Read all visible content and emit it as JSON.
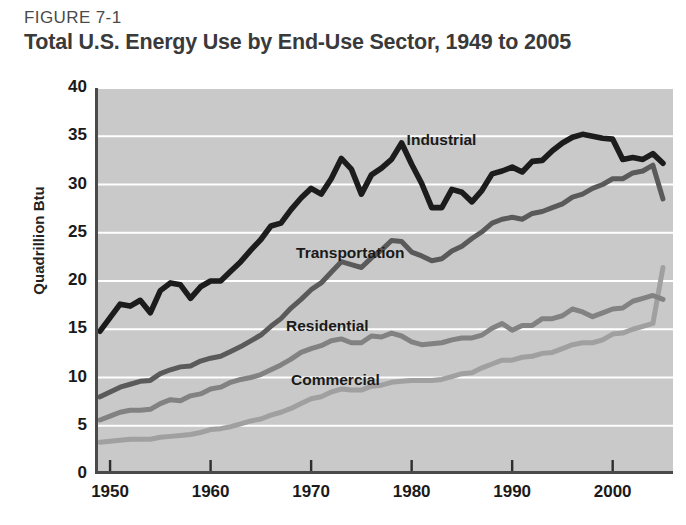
{
  "figure": {
    "number_label": "FIGURE 7-1",
    "title": "Total U.S. Energy Use by End-Use Sector, 1949 to 2005"
  },
  "axes": {
    "ylabel": "Quadrillion Btu",
    "yticks": [
      "0",
      "5",
      "10",
      "15",
      "20",
      "25",
      "30",
      "35",
      "40"
    ],
    "xticks": [
      "1950",
      "1960",
      "1970",
      "1980",
      "1990",
      "2000"
    ]
  },
  "series_labels": {
    "industrial": "Industrial",
    "transportation": "Transportation",
    "residential": "Residential",
    "commercial": "Commercial"
  },
  "colors": {
    "plot_background": "#c9c9c9",
    "gridline": "#ffffff",
    "axis": "#4a4a4a",
    "industrial": "#1c1c1c",
    "transportation": "#5a5a5a",
    "residential": "#828282",
    "commercial": "#a0a0a0",
    "title_text": "#3a3a3a",
    "label_text": "#4a4a4a"
  },
  "chart_data": {
    "type": "line",
    "title": "Total U.S. Energy Use by End-Use Sector, 1949 to 2005",
    "xlabel": "",
    "ylabel": "Quadrillion Btu",
    "xlim": [
      1948.5,
      2006
    ],
    "ylim": [
      0,
      40
    ],
    "ytick_step": 5,
    "xtick_values": [
      1950,
      1960,
      1970,
      1980,
      1990,
      2000
    ],
    "grid": "horizontal",
    "legend": "inline-labels",
    "x": [
      1949,
      1950,
      1951,
      1952,
      1953,
      1954,
      1955,
      1956,
      1957,
      1958,
      1959,
      1960,
      1961,
      1962,
      1963,
      1964,
      1965,
      1966,
      1967,
      1968,
      1969,
      1970,
      1971,
      1972,
      1973,
      1974,
      1975,
      1976,
      1977,
      1978,
      1979,
      1980,
      1981,
      1982,
      1983,
      1984,
      1985,
      1986,
      1987,
      1988,
      1989,
      1990,
      1991,
      1992,
      1993,
      1994,
      1995,
      1996,
      1997,
      1998,
      1999,
      2000,
      2001,
      2002,
      2003,
      2004,
      2005
    ],
    "series": [
      {
        "name": "Industrial",
        "color": "#1c1c1c",
        "values": [
          14.8,
          16.2,
          17.6,
          17.4,
          18.0,
          16.7,
          19.0,
          19.8,
          19.6,
          18.2,
          19.4,
          20.0,
          20.0,
          21.0,
          22.0,
          23.2,
          24.3,
          25.7,
          26.0,
          27.4,
          28.6,
          29.6,
          29.0,
          30.6,
          32.7,
          31.6,
          29.0,
          31.0,
          31.7,
          32.6,
          34.3,
          32.1,
          30.1,
          27.6,
          27.6,
          29.5,
          29.2,
          28.2,
          29.4,
          31.1,
          31.4,
          31.8,
          31.3,
          32.4,
          32.5,
          33.5,
          34.3,
          34.9,
          35.2,
          35.0,
          34.8,
          34.7,
          32.6,
          32.8,
          32.6,
          33.2,
          32.2
        ]
      },
      {
        "name": "Transportation",
        "color": "#5a5a5a",
        "values": [
          8.0,
          8.5,
          9.0,
          9.3,
          9.6,
          9.7,
          10.4,
          10.8,
          11.1,
          11.2,
          11.7,
          12.0,
          12.2,
          12.7,
          13.2,
          13.8,
          14.4,
          15.3,
          16.1,
          17.2,
          18.1,
          19.1,
          19.8,
          20.9,
          22.0,
          21.7,
          21.4,
          22.4,
          23.2,
          24.2,
          24.1,
          23.0,
          22.6,
          22.1,
          22.3,
          23.1,
          23.6,
          24.4,
          25.1,
          26.0,
          26.4,
          26.6,
          26.4,
          27.0,
          27.2,
          27.6,
          28.0,
          28.7,
          29.0,
          29.6,
          30.0,
          30.6,
          30.6,
          31.2,
          31.4,
          32.0,
          28.5
        ]
      },
      {
        "name": "Residential",
        "color": "#828282",
        "values": [
          5.6,
          6.0,
          6.4,
          6.6,
          6.6,
          6.7,
          7.3,
          7.7,
          7.6,
          8.1,
          8.3,
          8.8,
          9.0,
          9.5,
          9.8,
          10.0,
          10.3,
          10.8,
          11.3,
          11.9,
          12.6,
          13.0,
          13.3,
          13.8,
          14.0,
          13.6,
          13.6,
          14.3,
          14.2,
          14.6,
          14.3,
          13.7,
          13.4,
          13.5,
          13.6,
          13.9,
          14.1,
          14.1,
          14.4,
          15.1,
          15.6,
          14.9,
          15.4,
          15.4,
          16.1,
          16.1,
          16.4,
          17.1,
          16.8,
          16.3,
          16.7,
          17.1,
          17.2,
          17.9,
          18.2,
          18.5,
          18.1
        ]
      },
      {
        "name": "Commercial",
        "color": "#a0a0a0",
        "values": [
          3.3,
          3.4,
          3.5,
          3.6,
          3.6,
          3.6,
          3.8,
          3.9,
          4.0,
          4.1,
          4.3,
          4.6,
          4.7,
          4.9,
          5.2,
          5.5,
          5.7,
          6.1,
          6.4,
          6.8,
          7.3,
          7.8,
          8.0,
          8.5,
          8.8,
          8.7,
          8.7,
          9.1,
          9.2,
          9.5,
          9.6,
          9.7,
          9.7,
          9.7,
          9.8,
          10.1,
          10.4,
          10.5,
          11.0,
          11.4,
          11.8,
          11.8,
          12.1,
          12.2,
          12.5,
          12.6,
          13.0,
          13.4,
          13.6,
          13.6,
          13.9,
          14.5,
          14.6,
          15.0,
          15.3,
          15.6,
          21.4
        ]
      }
    ],
    "annotations": [
      {
        "text": "Industrial",
        "x": 1979.5,
        "y": 34.5
      },
      {
        "text": "Transportation",
        "x": 1968.5,
        "y": 22.8
      },
      {
        "text": "Residential",
        "x": 1967.5,
        "y": 15.2
      },
      {
        "text": "Commercial",
        "x": 1968.0,
        "y": 9.6
      }
    ]
  }
}
